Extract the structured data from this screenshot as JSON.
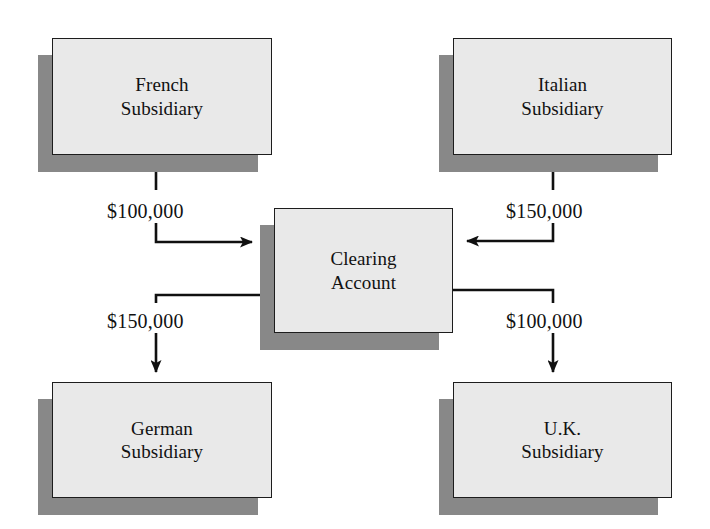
{
  "diagram": {
    "type": "flow-diagram",
    "colors": {
      "node_fill": "#e9e9e9",
      "node_border": "#1d1d1d",
      "shadow": "#888888",
      "background": "#ffffff",
      "text": "#111111"
    },
    "nodes": [
      {
        "id": "french",
        "label": "French\nSubsidiary",
        "line1": "French",
        "line2": "Subsidiary",
        "x": 52,
        "y": 38,
        "w": 220,
        "h": 117
      },
      {
        "id": "italian",
        "label": "Italian\nSubsidiary",
        "line1": "Italian",
        "line2": "Subsidiary",
        "x": 453,
        "y": 38,
        "w": 219,
        "h": 117
      },
      {
        "id": "clearing",
        "label": "Clearing\nAccount",
        "line1": "Clearing",
        "line2": "Account",
        "x": 274,
        "y": 208,
        "w": 179,
        "h": 125
      },
      {
        "id": "german",
        "label": "German\nSubsidiary",
        "line1": "German",
        "line2": "Subsidiary",
        "x": 52,
        "y": 382,
        "w": 220,
        "h": 116
      },
      {
        "id": "uk",
        "label": "U.K.\nSubsidiary",
        "line1": "U.K.",
        "line2": "Subsidiary",
        "x": 453,
        "y": 382,
        "w": 219,
        "h": 116
      }
    ],
    "edges": [
      {
        "id": "french-to-clearing",
        "from": "french",
        "to": "clearing",
        "amount": "$100,000",
        "direction": "right",
        "label_x": 104,
        "label_y": 200
      },
      {
        "id": "italian-to-clearing",
        "from": "italian",
        "to": "clearing",
        "amount": "$150,000",
        "direction": "left",
        "label_x": 524,
        "label_y": 200
      },
      {
        "id": "clearing-to-german",
        "from": "clearing",
        "to": "german",
        "amount": "$150,000",
        "direction": "down",
        "label_x": 104,
        "label_y": 310
      },
      {
        "id": "clearing-to-uk",
        "from": "clearing",
        "to": "uk",
        "amount": "$100,000",
        "direction": "down",
        "label_x": 524,
        "label_y": 310
      }
    ]
  }
}
